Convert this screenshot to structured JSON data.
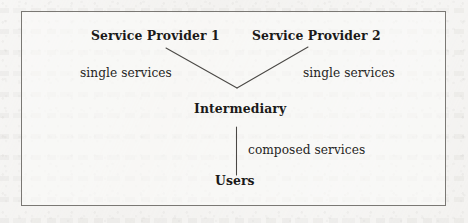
{
  "figure": {
    "kind": "flow-diagram",
    "ink_color": "#1b1a19",
    "frame_color": "#7a7874",
    "page_color": "#f3f2f0",
    "nodes": [
      {
        "id": "service-provider-1",
        "label": "Service Provider 1",
        "emphasis": "bold"
      },
      {
        "id": "service-provider-2",
        "label": "Service Provider 2",
        "emphasis": "bold"
      },
      {
        "id": "intermediary",
        "label": "Intermediary",
        "emphasis": "bold"
      },
      {
        "id": "users",
        "label": "Users",
        "emphasis": "bold"
      }
    ],
    "edges": [
      {
        "id": "sp1-to-intermediary",
        "from": "service-provider-1",
        "to": "intermediary",
        "label": "single services",
        "shape": "diagonal"
      },
      {
        "id": "sp2-to-intermediary",
        "from": "service-provider-2",
        "to": "intermediary",
        "label": "single services",
        "shape": "diagonal"
      },
      {
        "id": "intermediary-to-users",
        "from": "intermediary",
        "to": "users",
        "label": "composed services",
        "shape": "vertical"
      }
    ],
    "labels": {
      "service_provider_1": "Service Provider 1",
      "service_provider_2": "Service Provider 2",
      "intermediary": "Intermediary",
      "users": "Users",
      "single_services_left": "single services",
      "single_services_right": "single services",
      "composed_services": "composed services"
    }
  }
}
